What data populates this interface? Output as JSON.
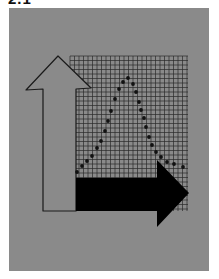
{
  "title": "2.1",
  "colors": {
    "background": "#ffffff",
    "panel": "#8a8a8a",
    "grid_line": "#2a2a2a",
    "up_arrow_fill": "#8a8a8a",
    "up_arrow_stroke": "#1a1a1a",
    "right_arrow_fill": "#000000",
    "curve_dots": "#111111"
  },
  "diagram": {
    "grid": {
      "x": 70,
      "y": 56,
      "width": 118,
      "height": 155,
      "spacing": 4.5
    },
    "up_arrow": {
      "label": "up-arrow",
      "points": "58,56 26,90 43,89 43,211 76,211 76,89 91,88"
    },
    "right_arrow": {
      "label": "right-arrow",
      "points": "76,178 157,178 157,160 189,193 157,227 157,211 76,211"
    },
    "curve_dots": [
      [
        77,
        172
      ],
      [
        82,
        166
      ],
      [
        87,
        161
      ],
      [
        92,
        156
      ],
      [
        97,
        148
      ],
      [
        101,
        141
      ],
      [
        105,
        131
      ],
      [
        108,
        121
      ],
      [
        111,
        111
      ],
      [
        115,
        99
      ],
      [
        119,
        89
      ],
      [
        123,
        82
      ],
      [
        128,
        78
      ],
      [
        133,
        84
      ],
      [
        136,
        92
      ],
      [
        139,
        102
      ],
      [
        141,
        110
      ],
      [
        144,
        118
      ],
      [
        146,
        127
      ],
      [
        149,
        137
      ],
      [
        152,
        145
      ],
      [
        156,
        152
      ],
      [
        161,
        157
      ],
      [
        167,
        162
      ],
      [
        174,
        164
      ],
      [
        183,
        167
      ]
    ]
  }
}
